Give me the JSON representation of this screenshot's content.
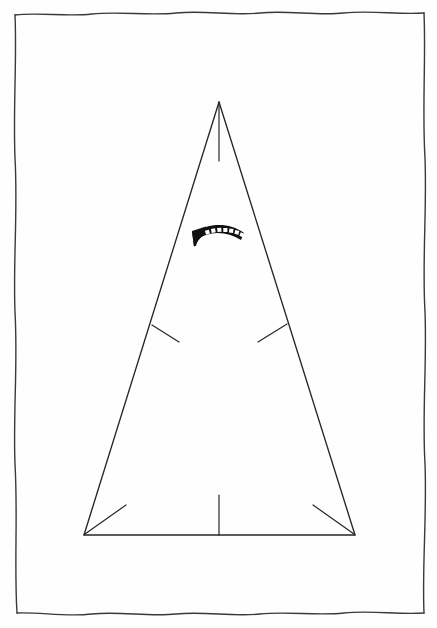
{
  "page": {
    "title": "Hand-drawn triangle diagram",
    "background_color": "#fefefe",
    "ink_color": "#262626",
    "width": 437,
    "height": 628
  },
  "frame": {
    "name": "hand-drawn-border",
    "description": "Wobbly hand-inked rectangular border enclosing the drawing",
    "stroke_color": "#3a3a3a",
    "stroke_width": 1.4,
    "left": 15,
    "top": 13,
    "right": 424,
    "bottom": 613
  },
  "diagram": {
    "name": "triangle-figure",
    "stroke_color": "#262626",
    "stroke_width": 1.3,
    "apex": {
      "x": 219,
      "y": 102
    },
    "base_left": {
      "x": 84,
      "y": 535
    },
    "base_right": {
      "x": 355,
      "y": 535
    },
    "elements": [
      {
        "name": "left-leg",
        "label": "Left leg",
        "from": {
          "x": 219,
          "y": 102
        },
        "to": {
          "x": 84,
          "y": 535
        }
      },
      {
        "name": "right-leg",
        "label": "Right leg",
        "from": {
          "x": 219,
          "y": 102
        },
        "to": {
          "x": 355,
          "y": 535
        }
      },
      {
        "name": "base-line",
        "label": "Base",
        "from": {
          "x": 84,
          "y": 535
        },
        "to": {
          "x": 355,
          "y": 535
        }
      },
      {
        "name": "apex-seam-line",
        "label": "Vertical seam below apex",
        "from": {
          "x": 219,
          "y": 104
        },
        "to": {
          "x": 219,
          "y": 161
        }
      },
      {
        "name": "left-mid-tick",
        "label": "Left mid-height tick",
        "from": {
          "x": 152,
          "y": 325
        },
        "to": {
          "x": 179,
          "y": 342
        }
      },
      {
        "name": "right-mid-tick",
        "label": "Right mid-height tick",
        "from": {
          "x": 287,
          "y": 324
        },
        "to": {
          "x": 258,
          "y": 342
        }
      },
      {
        "name": "base-center-tick",
        "label": "Center vertical tick at base",
        "from": {
          "x": 219,
          "y": 495
        },
        "to": {
          "x": 219,
          "y": 535
        }
      },
      {
        "name": "base-left-corner-tick",
        "label": "Diagonal tick at left corner",
        "from": {
          "x": 85,
          "y": 534
        },
        "to": {
          "x": 126,
          "y": 505
        }
      },
      {
        "name": "base-right-corner-tick",
        "label": "Diagonal tick at right corner",
        "from": {
          "x": 354,
          "y": 534
        },
        "to": {
          "x": 313,
          "y": 505
        }
      }
    ]
  },
  "annotation": {
    "name": "curved-arrow",
    "label": "Curved arrow pointing left",
    "description": "Thick solid black arc with seven white square notches along its upper edge and an arrowhead at the left end",
    "fill_color": "#111111",
    "notch_color": "#ffffff",
    "notch_count": 7,
    "bounds": {
      "x": 192,
      "y": 226,
      "width": 54,
      "height": 22
    },
    "direction": "left"
  }
}
